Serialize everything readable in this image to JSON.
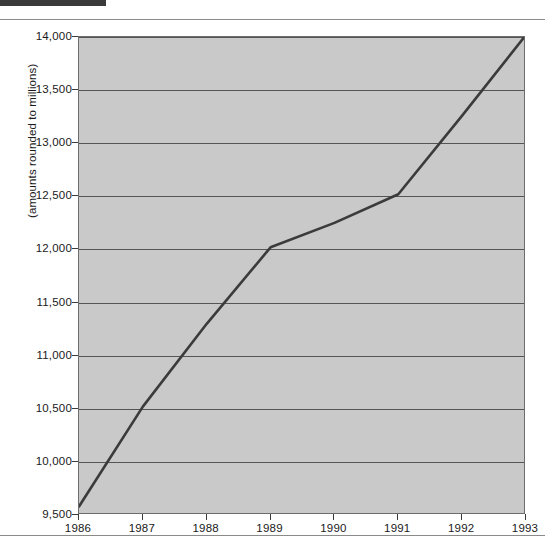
{
  "page": {
    "background_color": "#ffffff",
    "marker_bar_color": "#3a3a3a",
    "rule_color": "#8a8a8a"
  },
  "chart_data": {
    "type": "line",
    "title": "",
    "subtitle": "",
    "xlabel": "",
    "ylabel": "(amounts rounded to millions)",
    "categories": [
      "1986",
      "1987",
      "1988",
      "1989",
      "1990",
      "1991",
      "1992",
      "1993"
    ],
    "x": [
      1986,
      1987,
      1988,
      1989,
      1990,
      1991,
      1992,
      1993
    ],
    "values": [
      9580,
      10520,
      11300,
      12020,
      12250,
      12520,
      13260,
      14020
    ],
    "series": [
      {
        "name": "",
        "values": [
          9580,
          10520,
          11300,
          12020,
          12250,
          12520,
          13260,
          14020
        ]
      }
    ],
    "ylim": [
      9500,
      14000
    ],
    "xlim": [
      1986,
      1993
    ],
    "yticks": [
      9500,
      10000,
      10500,
      11000,
      11500,
      12000,
      12500,
      13000,
      13500,
      14000
    ],
    "ytick_labels": [
      "9,500",
      "10,000",
      "10,500",
      "11,000",
      "11,500",
      "12,000",
      "12,500",
      "13,000",
      "13,500",
      "14,000"
    ],
    "xtick_labels": [
      "1986",
      "1987",
      "1988",
      "1989",
      "1990",
      "1991",
      "1992",
      "1993"
    ],
    "grid": "horizontal",
    "legend": "none",
    "plot_background_color": "#c9c9c9",
    "grid_color": "#555555",
    "line_color": "#3b3b3b",
    "axis_color": "#6d6d6d",
    "annotations": []
  }
}
